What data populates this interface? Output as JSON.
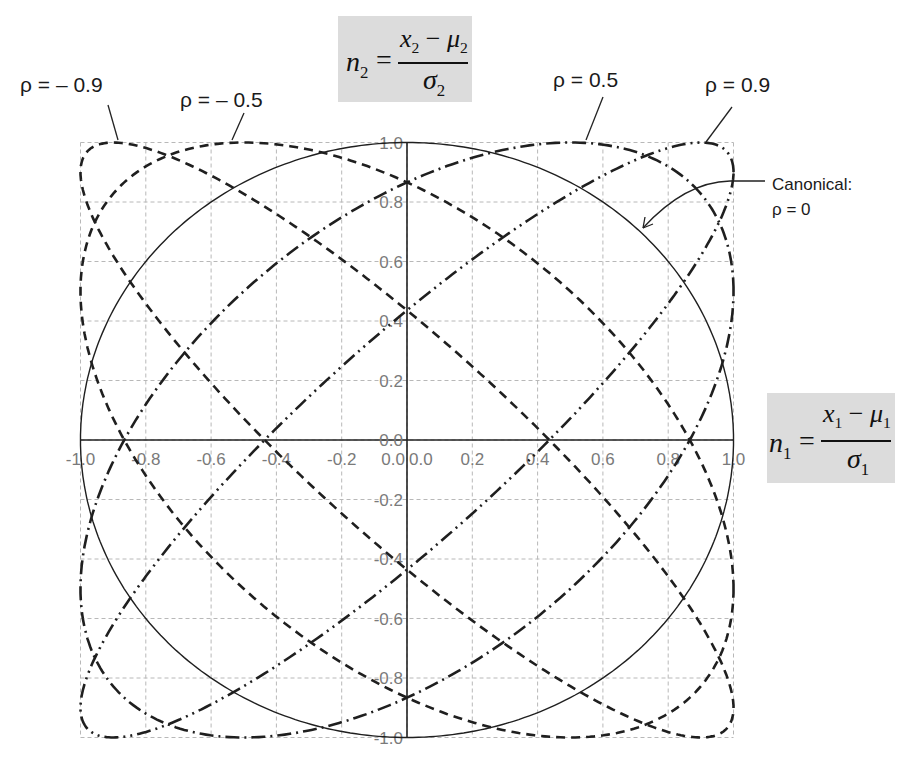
{
  "chart_data": {
    "type": "line",
    "title": "",
    "xlabel": "n1 = (x1 - μ1) / σ1",
    "ylabel": "n2 = (x2 - μ2) / σ2",
    "xlim": [
      -1.0,
      1.0
    ],
    "ylim": [
      -1.0,
      1.0
    ],
    "grid": true,
    "grid_step": 0.2,
    "x_ticks": [
      "-1.0",
      "-0.8",
      "-0.6",
      "-0.4",
      "-0.2",
      "0.0",
      "0.0",
      "0.2",
      "0.4",
      "0.6",
      "0.8",
      "1.0"
    ],
    "y_ticks": [
      "1.0",
      "0.8",
      "0.6",
      "0.4",
      "0.2",
      "0.0",
      "-0.2",
      "-0.4",
      "-0.6",
      "-0.8",
      "-1.0"
    ],
    "series": [
      {
        "name": "ρ = – 0.9",
        "rho": -0.9,
        "style": "dashed",
        "axis_intercepts": [
          0.436,
          -0.436
        ]
      },
      {
        "name": "ρ = – 0.5",
        "rho": -0.5,
        "style": "dashed",
        "axis_intercepts": [
          0.866,
          -0.866
        ]
      },
      {
        "name": "Canonical: ρ = 0",
        "rho": 0.0,
        "style": "solid",
        "axis_intercepts": [
          1.0,
          -1.0
        ]
      },
      {
        "name": "ρ = 0.5",
        "rho": 0.5,
        "style": "dash-dot",
        "axis_intercepts": [
          0.866,
          -0.866
        ]
      },
      {
        "name": "ρ = 0.9",
        "rho": 0.9,
        "style": "dash-dot-dot",
        "axis_intercepts": [
          0.436,
          -0.436
        ]
      }
    ],
    "annotations": [
      {
        "text": "ρ = – 0.9",
        "points_to": "top-left corner of ρ=-0.9 ellipse"
      },
      {
        "text": "ρ = – 0.5",
        "points_to": "top edge of ρ=-0.5 ellipse"
      },
      {
        "text": "ρ = 0.5",
        "points_to": "top edge of ρ=0.5 ellipse"
      },
      {
        "text": "ρ = 0.9",
        "points_to": "top-right corner of ρ=0.9 ellipse"
      },
      {
        "text": "Canonical: ρ = 0",
        "points_to": "unit circle"
      }
    ]
  },
  "labels": {
    "rho_m09": "ρ = – 0.9",
    "rho_m05": "ρ = – 0.5",
    "rho_p05": "ρ = 0.5",
    "rho_p09": "ρ = 0.9",
    "canonical_line1": "Canonical:",
    "canonical_line2": "ρ = 0"
  },
  "formulas": {
    "n2": {
      "lhs": "n",
      "lhs_sub": "2",
      "num_a": "x",
      "num_a_sub": "2",
      "minus": " − ",
      "num_b": "μ",
      "num_b_sub": "2",
      "den": "σ",
      "den_sub": "2"
    },
    "n1": {
      "lhs": "n",
      "lhs_sub": "1",
      "num_a": "x",
      "num_a_sub": "1",
      "minus": " − ",
      "num_b": "μ",
      "num_b_sub": "1",
      "den": "σ",
      "den_sub": "1"
    }
  },
  "colors": {
    "grid": "#b8b8b8",
    "curve": "#1f1f1f",
    "tick_text": "#7a7a7a",
    "formula_bg": "#dcdcdc"
  }
}
